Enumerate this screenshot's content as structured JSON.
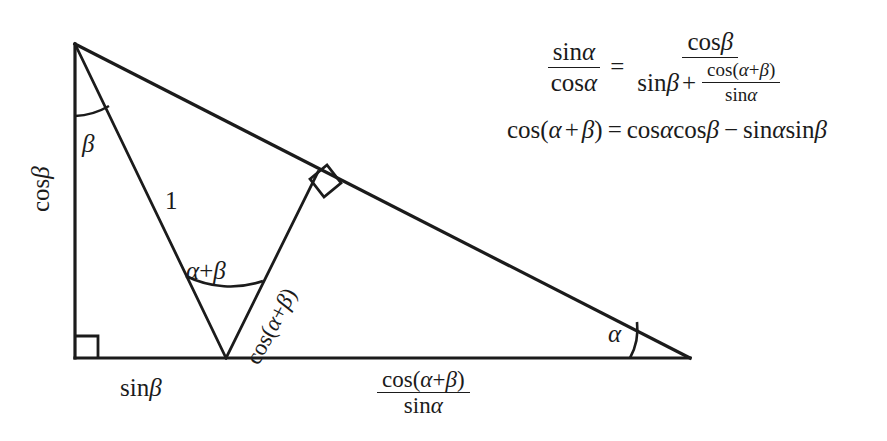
{
  "figure": {
    "stroke_color": "#1b1b1b",
    "background_color": "#ffffff",
    "triangle": {
      "apex": [
        75,
        44
      ],
      "bottom_left": [
        75,
        358
      ],
      "bottom_right": [
        690,
        358
      ],
      "inner_vertex": [
        226,
        358
      ],
      "perpendicular_foot": [
        318,
        172
      ]
    },
    "labels": {
      "left_side": "cos β",
      "base_left": "sin β",
      "unit_side": "1",
      "inner_angle": "α+β",
      "apex_angle": "β",
      "right_angle_label": "α",
      "perpendicular": "cos(α+β)"
    },
    "base_right_fraction": {
      "numerator": "cos(α+β)",
      "denominator": "sin α"
    },
    "right_angle_markers": [
      {
        "name": "bottom-left-corner",
        "x": 76,
        "y": 336
      },
      {
        "name": "perpendicular-foot-on-hypotenuse",
        "x": 318,
        "y": 172
      }
    ],
    "angle_arcs": [
      {
        "name": "beta-arc-at-apex"
      },
      {
        "name": "alpha-plus-beta-arc-at-inner-vertex"
      },
      {
        "name": "alpha-arc-at-right-vertex"
      }
    ]
  },
  "equations": {
    "equation_1": {
      "lhs": {
        "numerator": "sin α",
        "denominator": "cos α"
      },
      "relation": "=",
      "rhs": {
        "numerator": "cos β",
        "denominator": {
          "first_term": "sin β",
          "operator": "+",
          "second_term": {
            "numerator": "cos(α+β)",
            "denominator": "sin α"
          }
        }
      },
      "parts": {
        "sin": "sin",
        "cos": "cos",
        "alpha": "α",
        "beta": "β",
        "plus": "+",
        "equals": "=",
        "lparen": "(",
        "rparen": ")"
      }
    },
    "equation_2": {
      "text": "cos(α + β) = cos α cos β − sin α sin β",
      "parts": {
        "cos": "cos",
        "sin": "sin",
        "alpha": "α",
        "beta": "β",
        "plus": "+",
        "minus": "−",
        "equals": "=",
        "lparen": "(",
        "rparen": ")"
      }
    }
  }
}
